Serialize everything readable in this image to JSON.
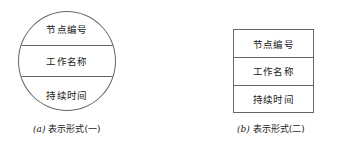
{
  "figure": {
    "background_color": "#ffffff",
    "line_color": "#666666",
    "text_color": "#1a1a1a",
    "node_fields": {
      "node_number": "节点编号",
      "activity_name": "工作名称",
      "duration": "持续时间"
    },
    "panels": [
      {
        "id": "circle-form",
        "shape": "circle",
        "caption_tag": "(a)",
        "caption_text": "表示形式(一)",
        "rows": [
          "节点编号",
          "工作名称",
          "持续时间"
        ]
      },
      {
        "id": "rect-form",
        "shape": "rectangle",
        "caption_tag": "(b)",
        "caption_text": "表示形式(二)",
        "rows": [
          "节点编号",
          "工作名称",
          "持续时间"
        ]
      }
    ]
  }
}
